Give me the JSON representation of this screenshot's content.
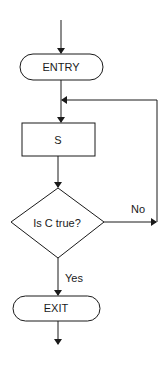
{
  "diagram": {
    "type": "flowchart",
    "nodes": {
      "entry": {
        "label": "ENTRY",
        "shape": "terminator"
      },
      "process": {
        "label": "S",
        "shape": "process"
      },
      "decision": {
        "label": "Is C true?",
        "shape": "decision"
      },
      "exit": {
        "label": "EXIT",
        "shape": "terminator"
      }
    },
    "edges": {
      "no_label": "No",
      "yes_label": "Yes"
    },
    "colors": {
      "stroke": "#1a1a1a",
      "background": "#ffffff"
    }
  }
}
